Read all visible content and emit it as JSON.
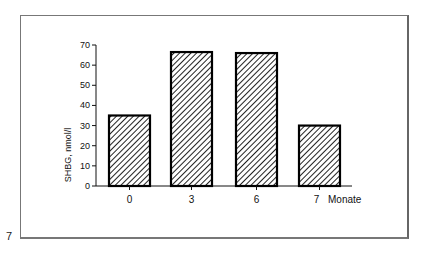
{
  "page": {
    "number": "7"
  },
  "chart_data": {
    "type": "bar",
    "title": "",
    "xlabel": "Monate",
    "ylabel": "SHBG, nmol/l",
    "categories": [
      "0",
      "3",
      "6",
      "7"
    ],
    "values": [
      35,
      66.5,
      66,
      30
    ],
    "ylim": [
      0,
      70
    ],
    "yticks": [
      0,
      10,
      20,
      30,
      40,
      50,
      60,
      70
    ],
    "grid": false,
    "legend": null,
    "bar_style": "diagonal-hatch",
    "x_unit_label": "Monate"
  },
  "axis": {
    "ytick_labels": [
      "0",
      "10",
      "20",
      "30",
      "40",
      "50",
      "60",
      "70"
    ],
    "xtick_labels": [
      "0",
      "3",
      "6",
      "7"
    ],
    "x_unit": "Monate",
    "y_title": "SHBG, nmol/l"
  }
}
